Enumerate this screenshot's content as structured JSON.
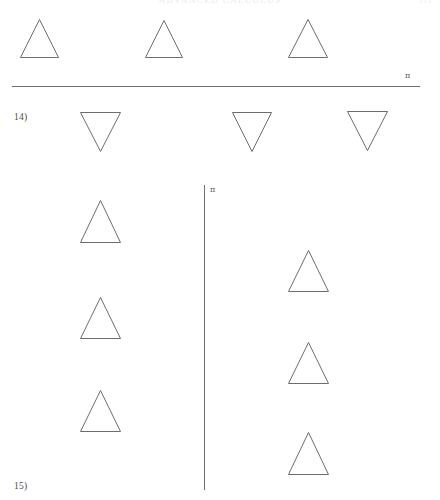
{
  "page": {
    "running_head": "ADVANCED CALCULUS",
    "folio": "371",
    "width": 440,
    "height": 500,
    "background": "#ffffff",
    "ink_color": "#6b6b74"
  },
  "labels": {
    "problem_14": "14)",
    "problem_15": "15)"
  },
  "axes": {
    "horizontal": {
      "name": "horizontal-axis-rule",
      "tick_label": "π",
      "x_start": 12,
      "x_end": 420,
      "y": 86
    },
    "vertical": {
      "name": "vertical-axis-rule",
      "tick_label": "π",
      "x": 204,
      "y_start": 185,
      "y_end": 490
    }
  },
  "figures": [
    {
      "id": "top-row",
      "orientation": "up",
      "count": 3,
      "shapes": [
        {
          "name": "triangle-up-1",
          "x": 20,
          "y": 19,
          "w": 39,
          "h": 39
        },
        {
          "name": "triangle-up-2",
          "x": 145,
          "y": 20,
          "w": 38,
          "h": 38
        },
        {
          "name": "triangle-up-3",
          "x": 288,
          "y": 19,
          "w": 40,
          "h": 39
        }
      ]
    },
    {
      "id": "problem-14-row",
      "orientation": "down",
      "count": 3,
      "shapes": [
        {
          "name": "triangle-down-1",
          "x": 80,
          "y": 112,
          "w": 41,
          "h": 40
        },
        {
          "name": "triangle-down-2",
          "x": 232,
          "y": 112,
          "w": 40,
          "h": 40
        },
        {
          "name": "triangle-down-3",
          "x": 347,
          "y": 111,
          "w": 41,
          "h": 40
        }
      ]
    },
    {
      "id": "problem-15-left-column",
      "orientation": "up",
      "count": 3,
      "shapes": [
        {
          "name": "triangle-up-left-1",
          "x": 80,
          "y": 200,
          "w": 41,
          "h": 43
        },
        {
          "name": "triangle-up-left-2",
          "x": 80,
          "y": 297,
          "w": 41,
          "h": 42
        },
        {
          "name": "triangle-up-left-3",
          "x": 80,
          "y": 390,
          "w": 41,
          "h": 42
        }
      ]
    },
    {
      "id": "problem-15-right-column",
      "orientation": "up",
      "count": 3,
      "shapes": [
        {
          "name": "triangle-up-right-1",
          "x": 288,
          "y": 250,
          "w": 41,
          "h": 42
        },
        {
          "name": "triangle-up-right-2",
          "x": 288,
          "y": 342,
          "w": 41,
          "h": 42
        },
        {
          "name": "triangle-up-right-3",
          "x": 288,
          "y": 432,
          "w": 41,
          "h": 43
        }
      ]
    }
  ]
}
